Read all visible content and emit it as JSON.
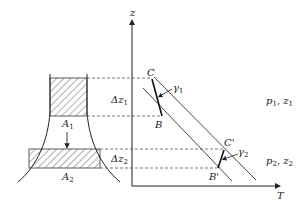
{
  "figure": {
    "type": "thermodynamic column diagram",
    "colors": {
      "line": "#333333",
      "dash": "#555555",
      "background": "#ffffff"
    },
    "axes": {
      "y_label": "z",
      "x_label": "T"
    },
    "column": {
      "area_top_label": "A",
      "area_top_sub": "1",
      "area_bottom_label": "A",
      "area_bottom_sub": "2",
      "arrow": "down-arrow"
    },
    "intervals": {
      "upper_label": "Δz",
      "upper_sub": "1",
      "lower_label": "Δz",
      "lower_sub": "2"
    },
    "points": {
      "C": "C",
      "B": "B",
      "C_prime": "C'",
      "B_prime": "B'"
    },
    "lapse_rates": {
      "upper": "γ",
      "upper_sub": "1",
      "lower": "γ",
      "lower_sub": "2"
    },
    "states": {
      "upper": {
        "p": "p",
        "p_sub": "1",
        "z": "z",
        "z_sub": "1",
        "sep": ", "
      },
      "lower": {
        "p": "p",
        "p_sub": "2",
        "z": "z",
        "z_sub": "2",
        "sep": ", "
      }
    }
  }
}
